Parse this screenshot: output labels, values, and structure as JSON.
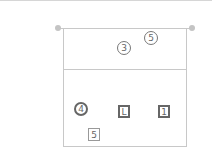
{
  "diagram": {
    "type": "volleyball-court-positions",
    "colors": {
      "lines": "#c8c8c8",
      "posts": "#c4c4c4",
      "marker_border": "#666666",
      "text": "#666666"
    },
    "opponent_side": {
      "players": [
        {
          "label": "3",
          "shape": "circle",
          "emphasis": false,
          "x": 124,
          "y": 48
        },
        {
          "label": "5",
          "shape": "circle",
          "emphasis": false,
          "x": 151,
          "y": 38
        }
      ]
    },
    "own_side": {
      "players": [
        {
          "label": "4",
          "shape": "circle",
          "emphasis": true,
          "x": 81,
          "y": 109
        },
        {
          "label": "L",
          "shape": "square",
          "emphasis": true,
          "x": 124,
          "y": 111
        },
        {
          "label": "1",
          "shape": "square",
          "emphasis": true,
          "x": 164,
          "y": 111
        },
        {
          "label": "5",
          "shape": "square",
          "emphasis": false,
          "x": 94,
          "y": 135
        }
      ]
    }
  }
}
